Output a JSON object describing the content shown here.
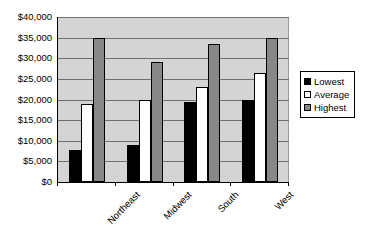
{
  "chart_data": {
    "type": "bar",
    "title": "",
    "xlabel": "",
    "ylabel": "",
    "categories": [
      "Northeast",
      "Midwest",
      "South",
      "West"
    ],
    "series": [
      {
        "name": "Lowest",
        "color": "#000000",
        "values": [
          7800,
          9000,
          19500,
          20000
        ]
      },
      {
        "name": "Average",
        "color": "#ffffff",
        "values": [
          19000,
          20000,
          23000,
          26500
        ]
      },
      {
        "name": "Highest",
        "color": "#888888",
        "values": [
          35000,
          29000,
          33500,
          34800
        ]
      }
    ],
    "ylim": [
      0,
      40000
    ],
    "ytick_values": [
      0,
      5000,
      10000,
      15000,
      20000,
      25000,
      30000,
      35000,
      40000
    ],
    "ytick_labels": [
      "$0",
      "$5,000",
      "$10,000",
      "$15,000",
      "$20,000",
      "$25,000",
      "$30,000",
      "$35,000",
      "$40,000"
    ],
    "grid": true,
    "legend_position": "right",
    "plot_background": "#d4d4d4"
  },
  "legend": {
    "items": [
      {
        "label": "Lowest"
      },
      {
        "label": "Average"
      },
      {
        "label": "Highest"
      }
    ]
  }
}
